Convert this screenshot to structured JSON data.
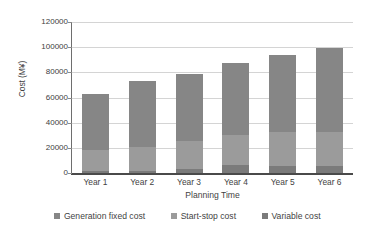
{
  "chart_data": {
    "type": "bar",
    "subtype": "stacked-column",
    "title": "",
    "xlabel": "Planning Time",
    "ylabel": "Cost (M¥)",
    "categories": [
      "Year 1",
      "Year 2",
      "Year 3",
      "Year 4",
      "Year 5",
      "Year 6"
    ],
    "series": [
      {
        "name": "Variable cost",
        "values": [
          1500,
          1800,
          2800,
          6000,
          5500,
          5200
        ],
        "color": "#7b7b7b"
      },
      {
        "name": "Start-stop cost",
        "values": [
          16500,
          19000,
          22500,
          24000,
          27500,
          27500
        ],
        "color": "#9b9b9b"
      },
      {
        "name": "Generation fixed cost",
        "values": [
          44500,
          52200,
          53700,
          57500,
          61000,
          66300
        ],
        "color": "#868686"
      }
    ],
    "totals": [
      62500,
      73000,
      79000,
      87500,
      94000,
      99000
    ],
    "yticks": [
      "0",
      "20000",
      "40000",
      "60000",
      "80000",
      "100000",
      "120000"
    ],
    "ylim": [
      0,
      120000
    ],
    "grid": true,
    "legend_position": "bottom",
    "legend": [
      "Generation fixed cost",
      "Start-stop cost",
      "Variable cost"
    ]
  },
  "axis": {
    "y_title": "Cost (M¥)",
    "x_title": "Planning Time",
    "y_ticks": [
      "120000",
      "100000",
      "80000",
      "60000",
      "40000",
      "20000",
      "0"
    ],
    "x_ticks": [
      "Year 1",
      "Year 2",
      "Year 3",
      "Year 4",
      "Year 5",
      "Year 6"
    ]
  },
  "legend": {
    "items": [
      {
        "label": "Generation fixed cost",
        "color": "#868686"
      },
      {
        "label": "Start-stop cost",
        "color": "#9b9b9b"
      },
      {
        "label": "Variable cost",
        "color": "#7b7b7b"
      }
    ]
  }
}
